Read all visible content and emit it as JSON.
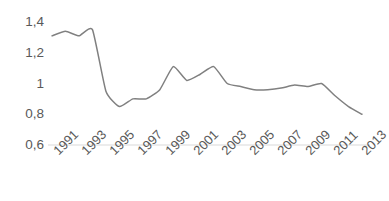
{
  "chart_data": {
    "type": "line",
    "title": "",
    "xlabel": "",
    "ylabel": "",
    "ylim": [
      0.6,
      1.4
    ],
    "ytick_labels": [
      "1,4",
      "1,2",
      "1",
      "0,8",
      "0,6"
    ],
    "ytick_values": [
      1.4,
      1.2,
      1.0,
      0.8,
      0.6
    ],
    "xtick_labels": [
      "1991",
      "1993",
      "1995",
      "1997",
      "1999",
      "2001",
      "2003",
      "2005",
      "2007",
      "2009",
      "2011",
      "2013"
    ],
    "xtick_values": [
      1991,
      1993,
      1995,
      1997,
      1999,
      2001,
      2003,
      2005,
      2007,
      2009,
      2011,
      2013
    ],
    "xlim": [
      1991,
      2014
    ],
    "grid": "baseline-only",
    "legend": "none",
    "series": [
      {
        "name": "series-1",
        "color": "#808080",
        "x": [
          1991,
          1992,
          1993,
          1994,
          1995,
          1996,
          1997,
          1998,
          1999,
          2000,
          2001,
          2002,
          2003,
          2004,
          2005,
          2006,
          2007,
          2008,
          2009,
          2010,
          2011,
          2012,
          2013,
          2014
        ],
        "values": [
          1.31,
          1.34,
          1.31,
          1.35,
          0.95,
          0.85,
          0.9,
          0.9,
          0.96,
          1.11,
          1.02,
          1.06,
          1.11,
          1.0,
          0.98,
          0.96,
          0.96,
          0.97,
          0.99,
          0.98,
          1.0,
          0.92,
          0.85,
          0.8
        ]
      }
    ]
  },
  "axis": {
    "y_labels": [
      "1,4",
      "1,2",
      "1",
      "0,8",
      "0,6"
    ],
    "x_labels": [
      "1991",
      "1993",
      "1995",
      "1997",
      "1999",
      "2001",
      "2003",
      "2005",
      "2007",
      "2009",
      "2011",
      "2013"
    ]
  },
  "style": {
    "line_color": "#808080",
    "text_color": "#595959",
    "axis_line_color": "#d9d9d9",
    "background": "#ffffff"
  }
}
